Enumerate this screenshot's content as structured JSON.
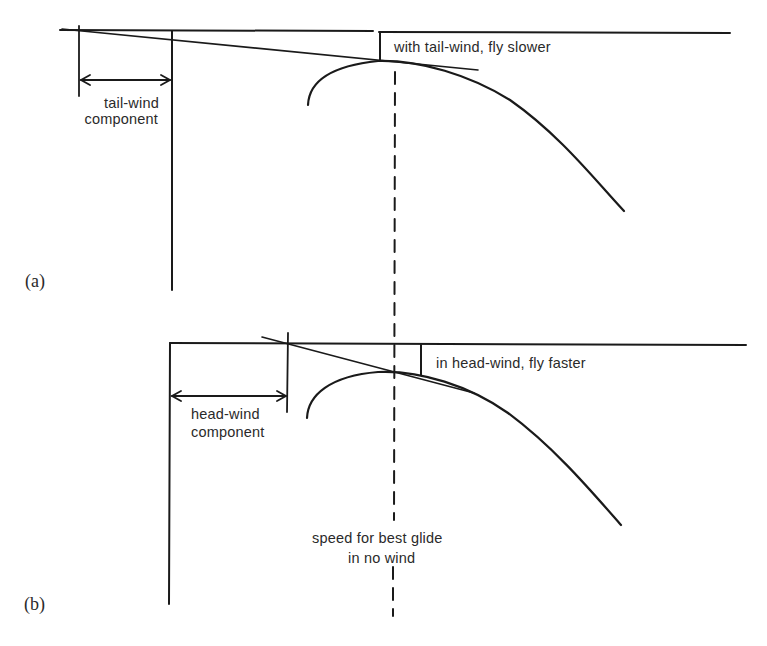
{
  "figure": {
    "panels": [
      {
        "id": "a",
        "label": "(a)",
        "annotation": "with tail-wind, fly slower",
        "component_label_line1": "tail-wind",
        "component_label_line2": "component"
      },
      {
        "id": "b",
        "label": "(b)",
        "annotation": "in head-wind, fly faster",
        "component_label_line1": "head-wind",
        "component_label_line2": "component"
      }
    ],
    "reference_label_line1": "speed for best glide",
    "reference_label_line2": "in no wind"
  },
  "colors": {
    "ink": "#1a1a1a",
    "background": "#ffffff"
  }
}
